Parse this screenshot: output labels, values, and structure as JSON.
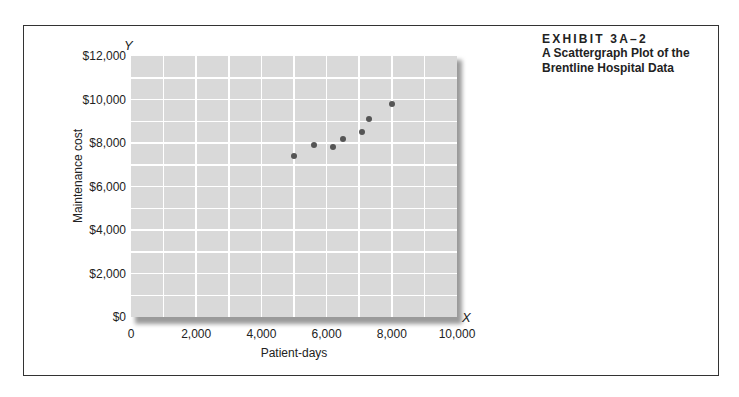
{
  "exhibit": {
    "number": "EXHIBIT 3A–2",
    "title": "A Scattergraph Plot of the Brentline Hospital Data"
  },
  "axes": {
    "y_letter": "Y",
    "x_letter": "X",
    "ylabel": "Maintenance cost",
    "xlabel": "Patient-days",
    "yticks": [
      "$0",
      "$2,000",
      "$4,000",
      "$6,000",
      "$8,000",
      "$10,000",
      "$12,000"
    ],
    "xticks": [
      "0",
      "2,000",
      "4,000",
      "6,000",
      "8,000",
      "10,000"
    ]
  },
  "colors": {
    "plot_bg": "#d9d9d9",
    "grid": "#ffffff",
    "point": "#555555"
  },
  "chart_data": {
    "type": "scatter",
    "title": "A Scattergraph Plot of the Brentline Hospital Data",
    "subtitle": "EXHIBIT 3A–2",
    "xlabel": "Patient-days",
    "ylabel": "Maintenance cost",
    "xlim": [
      0,
      10000
    ],
    "ylim": [
      0,
      12000
    ],
    "grid": true,
    "x_grid_step": 1000,
    "y_grid_step": 1000,
    "legend": null,
    "series": [
      {
        "name": "Brentline Hospital",
        "points": [
          {
            "x": 5000,
            "y": 7400
          },
          {
            "x": 5600,
            "y": 7900
          },
          {
            "x": 6200,
            "y": 7800
          },
          {
            "x": 6500,
            "y": 8200
          },
          {
            "x": 7100,
            "y": 8500
          },
          {
            "x": 7300,
            "y": 9100
          },
          {
            "x": 8000,
            "y": 9800
          }
        ]
      }
    ]
  }
}
